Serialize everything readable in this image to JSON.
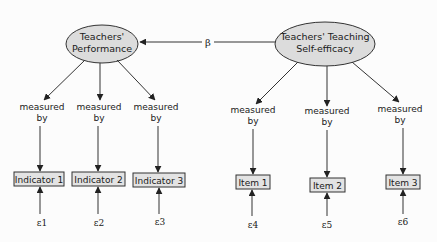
{
  "colors": {
    "ellipse_fill": "#dcdcdc",
    "box_fill": "#e3e3e3",
    "stroke": "#333333",
    "background": "#fcfcfc"
  },
  "latents": {
    "performance": {
      "line1": "Teachers'",
      "line2": "Performance"
    },
    "self_efficacy": {
      "line1": "Teachers' Teaching",
      "line2": "Self-efficacy"
    }
  },
  "path": {
    "label": "β",
    "from": "Teachers' Teaching Self-efficacy",
    "to": "Teachers' Performance"
  },
  "measure_label": {
    "line1": "measured",
    "line2": "by"
  },
  "indicators": [
    {
      "label": "Indicator 1",
      "error": "ε1"
    },
    {
      "label": "Indicator 2",
      "error": "ε2"
    },
    {
      "label": "Indicator 3",
      "error": "ε3"
    }
  ],
  "items": [
    {
      "label": "Item 1",
      "error": "ε4"
    },
    {
      "label": "Item 2",
      "error": "ε5"
    },
    {
      "label": "Item 3",
      "error": "ε6"
    }
  ]
}
